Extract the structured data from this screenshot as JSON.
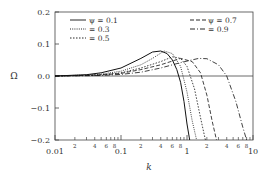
{
  "chart_data": {
    "type": "line",
    "title": "",
    "xlabel": "k",
    "ylabel": "Ω",
    "xscale": "log",
    "xlim": [
      0.01,
      10
    ],
    "ylim": [
      -0.2,
      0.2
    ],
    "grid": false,
    "x_ticks_major": [
      "0.01",
      "0.1",
      "1",
      "10"
    ],
    "x_ticks_minor_labels": [
      "2",
      "4",
      "6",
      "8"
    ],
    "y_ticks": [
      "0.2",
      "0.1",
      "0.0",
      "−0.1",
      "−0.2"
    ],
    "legend": [
      {
        "label": "ψ = 0.1",
        "style": "solid"
      },
      {
        "label": "= 0.3",
        "style": "dotted"
      },
      {
        "label": "= 0.5",
        "style": "dense-dotted"
      },
      {
        "label": "ψ = 0.7",
        "style": "dashed"
      },
      {
        "label": "= 0.9",
        "style": "dash-dot"
      }
    ],
    "series": [
      {
        "name": "ψ = 0.1",
        "style": "solid",
        "x": [
          0.01,
          0.03,
          0.05,
          0.1,
          0.2,
          0.3,
          0.4,
          0.5,
          0.6,
          0.7,
          0.8,
          0.9,
          1.0,
          1.1
        ],
        "y": [
          0.0,
          0.004,
          0.01,
          0.025,
          0.055,
          0.075,
          0.078,
          0.07,
          0.05,
          0.02,
          -0.02,
          -0.08,
          -0.15,
          -0.2
        ]
      },
      {
        "name": "ψ = 0.3",
        "style": "dotted",
        "x": [
          0.01,
          0.03,
          0.05,
          0.1,
          0.2,
          0.3,
          0.45,
          0.6,
          0.8,
          1.0,
          1.2,
          1.4
        ],
        "y": [
          0.0,
          0.003,
          0.006,
          0.015,
          0.035,
          0.055,
          0.078,
          0.07,
          0.03,
          -0.05,
          -0.14,
          -0.2
        ]
      },
      {
        "name": "ψ = 0.5",
        "style": "dense-dotted",
        "x": [
          0.01,
          0.03,
          0.05,
          0.1,
          0.2,
          0.4,
          0.6,
          0.8,
          1.0,
          1.3,
          1.6,
          1.9
        ],
        "y": [
          0.0,
          0.002,
          0.004,
          0.01,
          0.025,
          0.045,
          0.06,
          0.055,
          0.03,
          -0.04,
          -0.13,
          -0.2
        ]
      },
      {
        "name": "ψ = 0.7",
        "style": "dashed",
        "x": [
          0.01,
          0.03,
          0.05,
          0.1,
          0.2,
          0.4,
          0.8,
          1.2,
          1.6,
          2.0,
          2.4,
          2.8
        ],
        "y": [
          0.0,
          0.002,
          0.003,
          0.008,
          0.02,
          0.035,
          0.055,
          0.045,
          0.01,
          -0.06,
          -0.14,
          -0.2
        ]
      },
      {
        "name": "ψ = 0.9",
        "style": "dash-dot",
        "x": [
          0.01,
          0.03,
          0.05,
          0.1,
          0.2,
          0.4,
          0.8,
          1.5,
          2.0,
          3.0,
          4.0,
          5.5,
          7.0,
          8.0
        ],
        "y": [
          0.0,
          0.001,
          0.002,
          0.005,
          0.012,
          0.025,
          0.042,
          0.055,
          0.054,
          0.035,
          0.0,
          -0.08,
          -0.16,
          -0.2
        ]
      }
    ]
  }
}
